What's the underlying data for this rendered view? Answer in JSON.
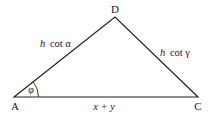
{
  "diagram": {
    "type": "triangle",
    "vertices": {
      "A": {
        "label": "A",
        "x": 14,
        "y": 97
      },
      "D": {
        "label": "D",
        "x": 115,
        "y": 17
      },
      "C": {
        "label": "C",
        "x": 198,
        "y": 97
      }
    },
    "sides": {
      "AD": {
        "label": "h cot α"
      },
      "DC": {
        "label": "h cot γ"
      },
      "AC": {
        "label": "x + y"
      }
    },
    "angle": {
      "vertex": "A",
      "label": "φ"
    },
    "colors": {
      "stroke": "#222222",
      "text": "#1a1a1a"
    }
  },
  "labels": {
    "A": "A",
    "D": "D",
    "C": "C",
    "ad_h": "h",
    "ad_rest": "cot α",
    "dc_h": "h",
    "dc_rest": "cot γ",
    "ac": "x + y",
    "phi": "φ"
  }
}
